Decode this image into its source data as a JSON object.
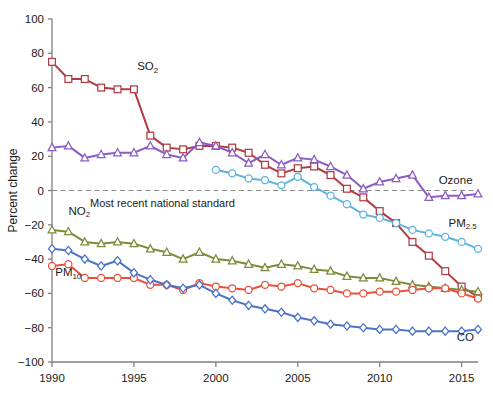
{
  "chart_data": {
    "type": "line",
    "title": "",
    "xlabel": "",
    "ylabel": "Percent change",
    "xlim": [
      1990,
      2016
    ],
    "ylim": [
      -100,
      100
    ],
    "ytick_values": [
      100,
      80,
      60,
      40,
      20,
      0,
      -20,
      -40,
      -60,
      -80,
      -100
    ],
    "ytick_labels": [
      "100",
      "80",
      "60",
      "40",
      "20",
      "0",
      "−20",
      "−40",
      "−60",
      "−80",
      "−100"
    ],
    "xtick_values": [
      1990,
      1995,
      2000,
      2005,
      2010,
      2015
    ],
    "xtick_labels": [
      "1990",
      "1995",
      "2000",
      "2005",
      "2010",
      "2015"
    ],
    "grid": false,
    "legend_position": "inline-right",
    "reference_line": {
      "value": 0,
      "label": "Most recent national standard",
      "style": "dashed",
      "color": "#8a8a8a"
    },
    "x": [
      1990,
      1991,
      1992,
      1993,
      1994,
      1995,
      1996,
      1997,
      1998,
      1999,
      2000,
      2001,
      2002,
      2003,
      2004,
      2005,
      2006,
      2007,
      2008,
      2009,
      2010,
      2011,
      2012,
      2013,
      2014,
      2015,
      2016
    ],
    "series": [
      {
        "name": "SO2",
        "label_html": "SO₂",
        "label_base": "SO",
        "label_sub": "2",
        "color": "#b03c44",
        "marker": "square",
        "label_x": 1995.2,
        "label_y": 70,
        "values": [
          75,
          65,
          65,
          60,
          59,
          59,
          32,
          25,
          24,
          26,
          26,
          25,
          22,
          15,
          10,
          13,
          14,
          9,
          1,
          -4,
          -12,
          -19,
          -30,
          -38,
          -47,
          -56,
          -62
        ]
      },
      {
        "name": "Ozone",
        "label_html": "Ozone",
        "label_base": "Ozone",
        "label_sub": "",
        "color": "#8b5cc4",
        "marker": "triangle",
        "label_x": 2013.6,
        "label_y": 4,
        "values": [
          25,
          26,
          19,
          21,
          22,
          22,
          26,
          21,
          19,
          28,
          26,
          22,
          16,
          21,
          15,
          19,
          18,
          14,
          9,
          1,
          5,
          7,
          9,
          -4,
          -3,
          -3,
          -2
        ]
      },
      {
        "name": "PM2.5",
        "label_html": "PM₂.₅",
        "label_base": "PM",
        "label_sub": "2.5",
        "color": "#5cb3e0",
        "marker": "circle",
        "label_x": 2014.2,
        "label_y": -21,
        "values": [
          null,
          null,
          null,
          null,
          null,
          null,
          null,
          null,
          null,
          null,
          12,
          10,
          7,
          6,
          3,
          8,
          2,
          -3,
          -8,
          -14,
          -16,
          -19,
          -23,
          -25,
          -27,
          -30,
          -34
        ]
      },
      {
        "name": "NO2",
        "label_html": "NO₂",
        "label_base": "NO",
        "label_sub": "2",
        "color": "#7b8c3a",
        "marker": "triangle",
        "label_x": 1991.0,
        "label_y": -14,
        "values": [
          -23,
          -24,
          -30,
          -31,
          -30,
          -31,
          -34,
          -36,
          -40,
          -36,
          -40,
          -41,
          -43,
          -45,
          -43,
          -44,
          -46,
          -47,
          -50,
          -51,
          -51,
          -53,
          -55,
          -56,
          -57,
          -58,
          -59
        ]
      },
      {
        "name": "PM10",
        "label_html": "PM₁₀",
        "label_base": "PM",
        "label_sub": "10",
        "color": "#e8503c",
        "marker": "circle",
        "label_x": 1990.2,
        "label_y": -50,
        "values": [
          -44,
          -43,
          -51,
          -51,
          -51,
          -51,
          -55,
          -55,
          -58,
          -54,
          -56,
          -57,
          -58,
          -55,
          -56,
          -54,
          -57,
          -58,
          -60,
          -60,
          -59,
          -59,
          -58,
          -57,
          -57,
          -60,
          -63
        ]
      },
      {
        "name": "CO",
        "label_html": "CO",
        "label_base": "CO",
        "label_sub": "",
        "color": "#4a72c8",
        "marker": "diamond",
        "label_x": 2014.7,
        "label_y": -88,
        "values": [
          -34,
          -35,
          -40,
          -44,
          -41,
          -48,
          -52,
          -55,
          -57,
          -55,
          -60,
          -64,
          -67,
          -69,
          -71,
          -74,
          -76,
          -78,
          -79,
          -80,
          -81,
          -81,
          -82,
          -82,
          -82,
          -82,
          -81
        ]
      }
    ]
  },
  "axis": {
    "ylabel": "Percent change"
  }
}
